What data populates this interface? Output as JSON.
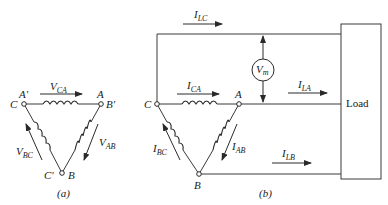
{
  "figure_a": {
    "caption": "(a)",
    "nodes": {
      "top_left": {
        "primary": "C",
        "secondary": "A'"
      },
      "top_right": {
        "primary": "A",
        "secondary": "B'"
      },
      "bottom": {
        "primary": "B",
        "secondary": "C'"
      }
    },
    "voltages": {
      "top": {
        "main": "V",
        "sub": "CA"
      },
      "right": {
        "main": "V",
        "sub": "AB"
      },
      "left": {
        "main": "V",
        "sub": "BC"
      }
    }
  },
  "figure_b": {
    "caption": "(b)",
    "nodes": {
      "C": "C",
      "A": "A",
      "B": "B"
    },
    "phase_currents": {
      "top": {
        "main": "I",
        "sub": "CA"
      },
      "right": {
        "main": "I",
        "sub": "AB"
      },
      "left": {
        "main": "I",
        "sub": "BC"
      }
    },
    "line_currents": {
      "lc": {
        "main": "I",
        "sub": "LC"
      },
      "la": {
        "main": "I",
        "sub": "LA"
      },
      "lb": {
        "main": "I",
        "sub": "LB"
      }
    },
    "meter": {
      "main": "V",
      "sub": "m"
    },
    "load_label": "Load"
  }
}
